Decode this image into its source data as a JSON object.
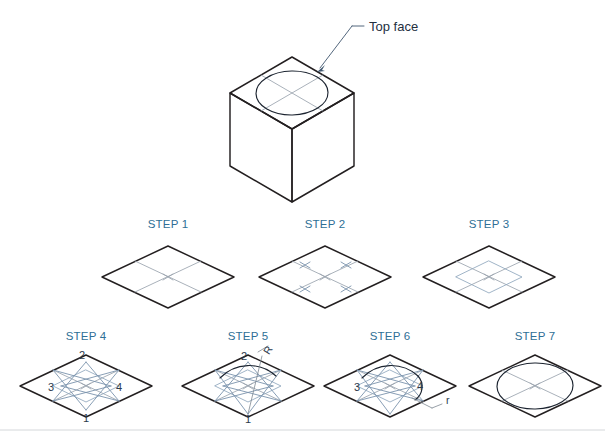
{
  "page": {
    "background_color": "#ffffff",
    "width": 605,
    "height": 444
  },
  "colors": {
    "step_label": "#2e6f96",
    "callout_text": "#24303f",
    "object_line": "#231f20",
    "construction_grey": "#9aa3ad",
    "construction_blue": "#8fa6bd",
    "leader_line": "#3f566e",
    "divider": "#d4d7da"
  },
  "callouts": {
    "top_face": {
      "label": "Top face",
      "leader_from_x": 352,
      "leader_from_y": 30,
      "leader_to_x": 316,
      "leader_to_y": 72
    }
  },
  "isometric_cube": {
    "name": "isometric-cube-with-circle-on-top-face",
    "center_x": 292,
    "center_y": 110,
    "description": "Isometric cube with a true circle drawn on the top face"
  },
  "steps": [
    {
      "id": 1,
      "label": "STEP 1",
      "label_x": 168,
      "label_y": 228,
      "center_x": 168,
      "center_y": 277,
      "description": "Draw the isometric square (rhombus) of the face, then add the centre lines joining midpoints of opposite sides.",
      "shows_numbers": false,
      "shows_inner_rhombus": false,
      "shows_midpoint_ticks": false,
      "shows_arcs": false,
      "shows_ellipse": false
    },
    {
      "id": 2,
      "label": "STEP 2",
      "label_x": 325,
      "label_y": 228,
      "center_x": 325,
      "center_y": 277,
      "description": "Mark the midpoints of each half centre line with small cross ticks.",
      "shows_numbers": false,
      "shows_inner_rhombus": false,
      "shows_midpoint_ticks": true,
      "shows_arcs": false,
      "shows_ellipse": false
    },
    {
      "id": 3,
      "label": "STEP 3",
      "label_x": 489,
      "label_y": 228,
      "center_x": 489,
      "center_y": 277,
      "description": "Join the marked midpoints to form the inner isometric square.",
      "shows_numbers": false,
      "shows_inner_rhombus": true,
      "shows_midpoint_ticks": false,
      "shows_arcs": false,
      "shows_ellipse": false
    },
    {
      "id": 4,
      "label": "STEP 4",
      "label_x": 86,
      "label_y": 340,
      "center_x": 86,
      "center_y": 386,
      "description": "Locate the four centres 1, 2, 3 and 4 and draw lines from the obtuse corners to the opposite side midpoints.",
      "shows_numbers": true,
      "shows_inner_rhombus": true,
      "shows_midpoint_ticks": false,
      "shows_arcs": false,
      "shows_ellipse": false,
      "point_labels": [
        {
          "text": "1",
          "x": 86,
          "y": 418,
          "position": "bottom"
        },
        {
          "text": "2",
          "x": 82,
          "y": 357,
          "position": "top"
        },
        {
          "text": "3",
          "x": 52,
          "y": 390,
          "position": "left"
        },
        {
          "text": "4",
          "x": 118,
          "y": 390,
          "position": "right"
        }
      ]
    },
    {
      "id": 5,
      "label": "STEP 5",
      "label_x": 248,
      "label_y": 340,
      "center_x": 248,
      "center_y": 386,
      "description": "With centre 1 and radius R, swing the large arc across the top of the figure.",
      "shows_numbers": true,
      "shows_inner_rhombus": true,
      "shows_midpoint_ticks": false,
      "shows_arcs": true,
      "shows_ellipse": false,
      "radius_label": "R",
      "radius_label_x": 268,
      "radius_label_y": 351,
      "point_labels": [
        {
          "text": "2",
          "x": 244,
          "y": 357,
          "position": "top"
        },
        {
          "text": "1",
          "x": 248,
          "y": 420,
          "position": "bottom"
        }
      ]
    },
    {
      "id": 6,
      "label": "STEP 6",
      "label_x": 390,
      "label_y": 340,
      "center_x": 390,
      "center_y": 386,
      "description": "With centres 3 and 4 and the smaller radius r, swing the two end arcs to close the curve.",
      "shows_numbers": true,
      "shows_inner_rhombus": true,
      "shows_midpoint_ticks": false,
      "shows_arcs": true,
      "shows_ellipse": false,
      "radius_label": "r",
      "radius_label_x": 430,
      "radius_label_y": 404,
      "point_labels": [
        {
          "text": "3",
          "x": 357,
          "y": 390,
          "position": "left"
        },
        {
          "text": "4",
          "x": 420,
          "y": 389,
          "position": "right"
        }
      ]
    },
    {
      "id": 7,
      "label": "STEP 7",
      "label_x": 535,
      "label_y": 340,
      "center_x": 535,
      "center_y": 386,
      "description": "The completed four-centre isometric ellipse inscribed in the isometric square.",
      "shows_numbers": false,
      "shows_inner_rhombus": false,
      "shows_midpoint_ticks": false,
      "shows_arcs": false,
      "shows_ellipse": true
    }
  ],
  "footer": {
    "divider_y": 430
  }
}
